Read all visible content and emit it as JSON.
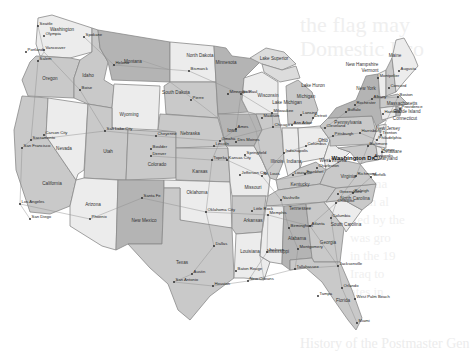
{
  "background_text": {
    "line1": "the flag may",
    "line2": "Domestic Eco",
    "side_lines": [
      "ade ma",
      "as an al",
      "lled by the",
      "was gro",
      "in the 19",
      "Iraq to",
      "ates in",
      "of the"
    ],
    "bottom": "History of the Postmaster Gen"
  },
  "map": {
    "title": "United States",
    "colors": {
      "light": "#ececec",
      "mid": "#c9c9c9",
      "dark": "#b4b4b4",
      "border": "#8a8a8a",
      "water": "#ffffff"
    },
    "states": [
      {
        "name": "Washington",
        "x": 62,
        "y": 31
      },
      {
        "name": "Oregon",
        "x": 50,
        "y": 80
      },
      {
        "name": "California",
        "x": 52,
        "y": 185
      },
      {
        "name": "Nevada",
        "x": 64,
        "y": 150
      },
      {
        "name": "Idaho",
        "x": 88,
        "y": 77
      },
      {
        "name": "Montana",
        "x": 133,
        "y": 63
      },
      {
        "name": "Wyoming",
        "x": 129,
        "y": 116
      },
      {
        "name": "Utah",
        "x": 108,
        "y": 153
      },
      {
        "name": "Arizona",
        "x": 93,
        "y": 206
      },
      {
        "name": "Colorado",
        "x": 157,
        "y": 166
      },
      {
        "name": "New Mexico",
        "x": 144,
        "y": 222
      },
      {
        "name": "North Dakota",
        "x": 200,
        "y": 57
      },
      {
        "name": "South Dakota",
        "x": 176,
        "y": 94
      },
      {
        "name": "Nebraska",
        "x": 190,
        "y": 135
      },
      {
        "name": "Kansas",
        "x": 200,
        "y": 173
      },
      {
        "name": "Oklahoma",
        "x": 197,
        "y": 194
      },
      {
        "name": "Texas",
        "x": 182,
        "y": 264
      },
      {
        "name": "Minnesota",
        "x": 226,
        "y": 64
      },
      {
        "name": "Iowa",
        "x": 232,
        "y": 132
      },
      {
        "name": "Missouri",
        "x": 253,
        "y": 189
      },
      {
        "name": "Arkansas",
        "x": 253,
        "y": 222
      },
      {
        "name": "Louisiana",
        "x": 250,
        "y": 253
      },
      {
        "name": "Wisconsin",
        "x": 268,
        "y": 97
      },
      {
        "name": "Illinois",
        "x": 277,
        "y": 163
      },
      {
        "name": "Michigan",
        "x": 306,
        "y": 98
      },
      {
        "name": "Lake Superior",
        "x": 274,
        "y": 60
      },
      {
        "name": "Lake Michigan",
        "x": 287,
        "y": 104
      },
      {
        "name": "Lake Huron",
        "x": 313,
        "y": 87
      },
      {
        "name": "Indiana",
        "x": 294,
        "y": 163
      },
      {
        "name": "Ohio",
        "x": 323,
        "y": 142
      },
      {
        "name": "Kentucky",
        "x": 300,
        "y": 186
      },
      {
        "name": "Tennessee",
        "x": 300,
        "y": 210
      },
      {
        "name": "Mississippi",
        "x": 278,
        "y": 253
      },
      {
        "name": "Alabama",
        "x": 297,
        "y": 240
      },
      {
        "name": "Georgia",
        "x": 328,
        "y": 244
      },
      {
        "name": "Florida",
        "x": 343,
        "y": 302
      },
      {
        "name": "South Carolina",
        "x": 346,
        "y": 226
      },
      {
        "name": "North Carolina",
        "x": 355,
        "y": 200
      },
      {
        "name": "Virginia",
        "x": 348,
        "y": 178
      },
      {
        "name": "West Virginia",
        "x": 333,
        "y": 162
      },
      {
        "name": "Pennsylvania",
        "x": 348,
        "y": 124
      },
      {
        "name": "New York",
        "x": 366,
        "y": 90
      },
      {
        "name": "Vermont",
        "x": 370,
        "y": 72
      },
      {
        "name": "New Hampshire",
        "x": 362,
        "y": 66
      },
      {
        "name": "Maine",
        "x": 395,
        "y": 57
      },
      {
        "name": "Massachusetts",
        "x": 402,
        "y": 105
      },
      {
        "name": "Rhode Island",
        "x": 407,
        "y": 113
      },
      {
        "name": "Connecticut",
        "x": 405,
        "y": 120
      },
      {
        "name": "New Jersey",
        "x": 388,
        "y": 130
      },
      {
        "name": "Delaware",
        "x": 392,
        "y": 153
      },
      {
        "name": "Maryland",
        "x": 388,
        "y": 160
      }
    ],
    "cities": [
      {
        "name": "Seattle",
        "x": 38,
        "y": 26
      },
      {
        "name": "Olympia",
        "x": 44,
        "y": 36
      },
      {
        "name": "Spokane",
        "x": 84,
        "y": 37
      },
      {
        "name": "Portland",
        "x": 26,
        "y": 52
      },
      {
        "name": "Vancouver",
        "x": 44,
        "y": 50
      },
      {
        "name": "Salem",
        "x": 38,
        "y": 61
      },
      {
        "name": "Boise",
        "x": 80,
        "y": 90
      },
      {
        "name": "Helena",
        "x": 114,
        "y": 65
      },
      {
        "name": "Bismarck",
        "x": 189,
        "y": 71
      },
      {
        "name": "Pierre",
        "x": 191,
        "y": 100
      },
      {
        "name": "Carson City",
        "x": 44,
        "y": 135
      },
      {
        "name": "Sacramento",
        "x": 31,
        "y": 140
      },
      {
        "name": "San Francisco",
        "x": 22,
        "y": 148
      },
      {
        "name": "Salt Lake City",
        "x": 105,
        "y": 131
      },
      {
        "name": "Cheyenne",
        "x": 156,
        "y": 136
      },
      {
        "name": "Boulder",
        "x": 151,
        "y": 149
      },
      {
        "name": "Denver",
        "x": 151,
        "y": 156
      },
      {
        "name": "Omaha",
        "x": 220,
        "y": 141
      },
      {
        "name": "Lincoln",
        "x": 214,
        "y": 146
      },
      {
        "name": "Des Moines",
        "x": 236,
        "y": 142
      },
      {
        "name": "Ames",
        "x": 236,
        "y": 129
      },
      {
        "name": "St. Paul",
        "x": 241,
        "y": 94
      },
      {
        "name": "Minneapolis",
        "x": 228,
        "y": 94
      },
      {
        "name": "Milwaukee",
        "x": 272,
        "y": 113
      },
      {
        "name": "Madison",
        "x": 262,
        "y": 118
      },
      {
        "name": "Chicago",
        "x": 273,
        "y": 127
      },
      {
        "name": "Lansing",
        "x": 301,
        "y": 115
      },
      {
        "name": "Detroit",
        "x": 313,
        "y": 118
      },
      {
        "name": "Ann Arbor",
        "x": 292,
        "y": 125
      },
      {
        "name": "Buffalo",
        "x": 346,
        "y": 112
      },
      {
        "name": "Rochester",
        "x": 355,
        "y": 105
      },
      {
        "name": "Albany",
        "x": 372,
        "y": 99
      },
      {
        "name": "Montpelier",
        "x": 378,
        "y": 78
      },
      {
        "name": "Concord",
        "x": 389,
        "y": 88
      },
      {
        "name": "Augusta",
        "x": 399,
        "y": 71
      },
      {
        "name": "Boston",
        "x": 398,
        "y": 97
      },
      {
        "name": "Providence",
        "x": 400,
        "y": 109
      },
      {
        "name": "Hartford",
        "x": 383,
        "y": 114
      },
      {
        "name": "Cleveland",
        "x": 325,
        "y": 128
      },
      {
        "name": "Columbus",
        "x": 306,
        "y": 146
      },
      {
        "name": "Pittsburgh",
        "x": 333,
        "y": 136
      },
      {
        "name": "Harrisburg",
        "x": 360,
        "y": 133
      },
      {
        "name": "Philadelphia",
        "x": 377,
        "y": 140
      },
      {
        "name": "Trenton",
        "x": 381,
        "y": 135
      },
      {
        "name": "Dover",
        "x": 382,
        "y": 152
      },
      {
        "name": "Annapolis",
        "x": 373,
        "y": 158
      },
      {
        "name": "Baltimore",
        "x": 368,
        "y": 146
      },
      {
        "name": "Washington D.C.",
        "x": 330,
        "y": 161
      },
      {
        "name": "Richmond",
        "x": 356,
        "y": 176
      },
      {
        "name": "Norfolk",
        "x": 371,
        "y": 177
      },
      {
        "name": "Charleston",
        "x": 317,
        "y": 168
      },
      {
        "name": "Frankfort",
        "x": 305,
        "y": 174
      },
      {
        "name": "Louisville",
        "x": 293,
        "y": 175
      },
      {
        "name": "Indianapolis",
        "x": 284,
        "y": 153
      },
      {
        "name": "Springfield",
        "x": 245,
        "y": 155
      },
      {
        "name": "Topeka",
        "x": 212,
        "y": 160
      },
      {
        "name": "Kansas City",
        "x": 227,
        "y": 160
      },
      {
        "name": "Jefferson City",
        "x": 240,
        "y": 175
      },
      {
        "name": "St. Louis",
        "x": 262,
        "y": 176
      },
      {
        "name": "Nashville",
        "x": 281,
        "y": 200
      },
      {
        "name": "Raleigh",
        "x": 353,
        "y": 193
      },
      {
        "name": "Greensboro",
        "x": 338,
        "y": 194
      },
      {
        "name": "Charlotte",
        "x": 336,
        "y": 203
      },
      {
        "name": "Columbia",
        "x": 331,
        "y": 218
      },
      {
        "name": "Atlanta",
        "x": 310,
        "y": 226
      },
      {
        "name": "Memphis",
        "x": 268,
        "y": 215
      },
      {
        "name": "Little Rock",
        "x": 252,
        "y": 211
      },
      {
        "name": "Oklahoma City",
        "x": 206,
        "y": 212
      },
      {
        "name": "Santa Fe",
        "x": 142,
        "y": 198
      },
      {
        "name": "Phoenix",
        "x": 90,
        "y": 219
      },
      {
        "name": "Los Angeles",
        "x": 20,
        "y": 204
      },
      {
        "name": "San Diego",
        "x": 30,
        "y": 219
      },
      {
        "name": "Dallas",
        "x": 214,
        "y": 246
      },
      {
        "name": "Austin",
        "x": 192,
        "y": 274
      },
      {
        "name": "San Antonio",
        "x": 174,
        "y": 282
      },
      {
        "name": "Houston",
        "x": 213,
        "y": 286
      },
      {
        "name": "Birmingham",
        "x": 289,
        "y": 228
      },
      {
        "name": "Montgomery",
        "x": 298,
        "y": 249
      },
      {
        "name": "Jackson",
        "x": 267,
        "y": 252
      },
      {
        "name": "Baton Rouge",
        "x": 236,
        "y": 271
      },
      {
        "name": "New Orleans",
        "x": 248,
        "y": 281
      },
      {
        "name": "Tallahassee",
        "x": 295,
        "y": 269
      },
      {
        "name": "Jacksonville",
        "x": 338,
        "y": 266
      },
      {
        "name": "Orlando",
        "x": 342,
        "y": 288
      },
      {
        "name": "Tampa",
        "x": 318,
        "y": 296
      },
      {
        "name": "West Palm Beach",
        "x": 355,
        "y": 299
      },
      {
        "name": "Miami",
        "x": 357,
        "y": 323
      }
    ]
  }
}
